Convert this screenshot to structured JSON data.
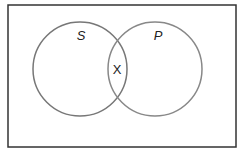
{
  "diagram": {
    "type": "venn",
    "frame": {
      "x": 8,
      "y": 5,
      "width": 228,
      "height": 142,
      "stroke": "#333333"
    },
    "sets": [
      {
        "name": "S",
        "cx": 80,
        "cy": 69,
        "r": 47,
        "stroke": "#777777",
        "label_x": 81,
        "label_y": 40
      },
      {
        "name": "P",
        "cx": 155,
        "cy": 69,
        "r": 47,
        "stroke": "#888888",
        "label_x": 158,
        "label_y": 40
      }
    ],
    "intersection_mark": {
      "text": "X",
      "x": 117,
      "y": 74
    }
  }
}
